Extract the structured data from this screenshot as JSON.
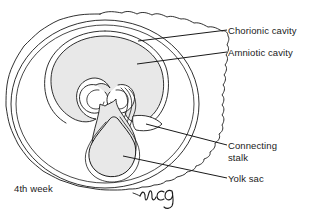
{
  "figure": {
    "stage_label": "4th week",
    "signature": "mcg",
    "background_color": "#ffffff",
    "ink_color": "#1a1a1a",
    "shading_color": "#e8e8e8"
  },
  "labels": {
    "chorionic_cavity": "Chorionic cavity",
    "amniotic_cavity": "Amniotic cavity",
    "connecting_stalk_line1": "Connecting",
    "connecting_stalk_line2": "stalk",
    "yolk_sac": "Yolk sac"
  },
  "structures": [
    {
      "name": "chorionic-villi-outline",
      "description": "outer wavy villous border of the chorion"
    },
    {
      "name": "chorion-outline",
      "description": "smooth outer chorionic membrane oval"
    },
    {
      "name": "chorionic-cavity",
      "description": "space between chorion and amnion"
    },
    {
      "name": "amnion-outline",
      "description": "amniotic membrane enclosing the amniotic cavity"
    },
    {
      "name": "amniotic-cavity",
      "description": "shaded cavity surrounding the embryo"
    },
    {
      "name": "embryo-body",
      "description": "folded embryonic disc with paired spiral folds"
    },
    {
      "name": "connecting-stalk",
      "description": "stalk linking embryo to chorion"
    },
    {
      "name": "yolk-sac",
      "description": "pear shaped shaded sac below the embryo"
    }
  ]
}
